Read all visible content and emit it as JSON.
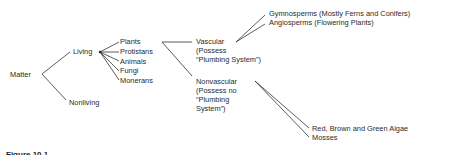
{
  "tree": {
    "root": "Matter",
    "level1": [
      "Living",
      "Nonliving"
    ],
    "living_children": [
      "Plants",
      "Protistans",
      "Animals",
      "Fungi",
      "Monerans"
    ],
    "plants_children": {
      "vascular": [
        "Vascular",
        "(Possess",
        "“Plumbing System”)"
      ],
      "nonvascular": [
        "Nonvascular",
        "(Possess no",
        "“Plumbing",
        "System”)"
      ]
    },
    "vascular_children": [
      "Gymnosperms (Mostly Ferns and Conifers)",
      "Angiosperms (Flowering Plants)"
    ],
    "nonvascular_children": [
      "Red, Brown and Green Algae",
      "Mosses"
    ]
  },
  "caption": "Figure 10.1"
}
